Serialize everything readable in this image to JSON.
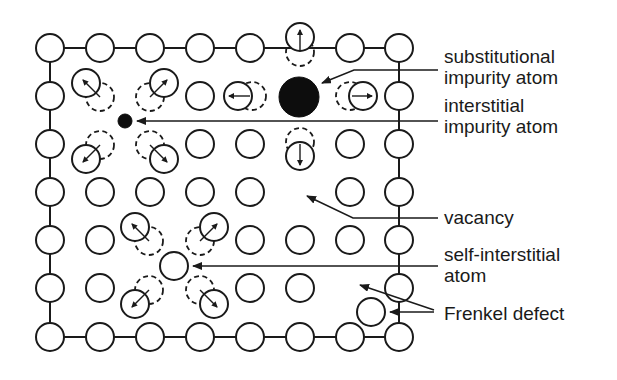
{
  "diagram": {
    "colors": {
      "stroke": "#1a1a1a",
      "fill": "#ffffff",
      "impurity": "#0d0d0d"
    },
    "grid": {
      "columns_x": [
        50,
        100,
        150,
        200,
        250,
        300,
        350,
        399
      ],
      "rows_y": [
        48,
        96,
        144,
        192,
        240,
        288,
        337
      ],
      "atom_radius": 14
    },
    "labels": [
      {
        "id": "substitutional",
        "lines": [
          "substitutional",
          "impurity atom"
        ],
        "x": 444,
        "y": 48
      },
      {
        "id": "interstitial",
        "lines": [
          "interstitial",
          "impurity atom"
        ],
        "x": 444,
        "y": 97
      },
      {
        "id": "vacancy",
        "lines": [
          "vacancy"
        ],
        "x": 444,
        "y": 206
      },
      {
        "id": "self-interstitial",
        "lines": [
          "self-interstitial",
          "atom"
        ],
        "x": 444,
        "y": 246
      },
      {
        "id": "frenkel",
        "lines": [
          "Frenkel defect"
        ],
        "x": 444,
        "y": 305
      }
    ],
    "defects": {
      "substitutional_impurity": {
        "cx": 299,
        "cy": 97,
        "r": 20
      },
      "interstitial_impurity": {
        "cx": 125,
        "cy": 121,
        "r": 7
      },
      "vacancy": {
        "cx": 300,
        "cy": 192
      },
      "self_interstitial": {
        "cx": 174,
        "cy": 266,
        "r": 14
      },
      "frenkel_interstitial": {
        "cx": 371,
        "cy": 312,
        "r": 14
      },
      "frenkel_vacancy_col_row": [
        7,
        5
      ]
    }
  }
}
